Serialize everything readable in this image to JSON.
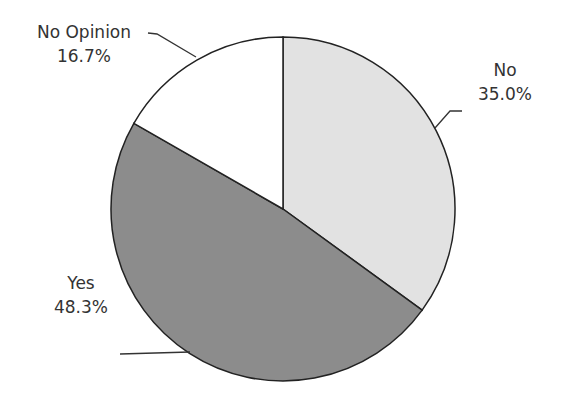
{
  "chart_data": {
    "type": "pie",
    "title": "",
    "categories": [
      "No",
      "Yes",
      "No Opinion"
    ],
    "values": [
      35.0,
      48.3,
      16.7
    ],
    "value_labels": [
      "35.0%",
      "48.3%",
      "16.7%"
    ],
    "start_angle": "12 o'clock, clockwise",
    "colors": [
      "#e2e2e2",
      "#8c8c8c",
      "#ffffff"
    ],
    "legend": "none (data labels with leader lines)"
  },
  "labels": {
    "no": {
      "name": "No",
      "pct": "35.0%"
    },
    "yes": {
      "name": "Yes",
      "pct": "48.3%"
    },
    "noopinion": {
      "name": "No Opinion",
      "pct": "16.7%"
    }
  }
}
